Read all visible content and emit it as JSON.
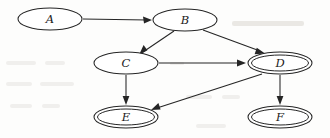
{
  "diagram": {
    "type": "directed-graph",
    "title": "",
    "background_color": "#fdfdfc",
    "stroke_color": "#252525",
    "node_fill": "#ffffff",
    "nodes": [
      {
        "id": "A",
        "label": "A",
        "cx": 50,
        "cy": 19,
        "rx": 32,
        "ry": 11,
        "shape": "ellipse",
        "double": false
      },
      {
        "id": "B",
        "label": "B",
        "cx": 185,
        "cy": 20,
        "rx": 32,
        "ry": 11,
        "shape": "ellipse",
        "double": false
      },
      {
        "id": "C",
        "label": "C",
        "cx": 126,
        "cy": 63,
        "rx": 32,
        "ry": 11,
        "shape": "ellipse",
        "double": false
      },
      {
        "id": "D",
        "label": "D",
        "cx": 280,
        "cy": 63,
        "rx": 32,
        "ry": 11,
        "shape": "double-ellipse",
        "double": true
      },
      {
        "id": "E",
        "label": "E",
        "cx": 126,
        "cy": 117,
        "rx": 32,
        "ry": 11,
        "shape": "double-ellipse",
        "double": true
      },
      {
        "id": "F",
        "label": "F",
        "cx": 280,
        "cy": 117,
        "rx": 32,
        "ry": 11,
        "shape": "double-ellipse",
        "double": true
      }
    ],
    "edges": [
      {
        "id": "A-B",
        "from": "A",
        "to": "B",
        "x1": 83,
        "y1": 19,
        "x2": 151,
        "y2": 20,
        "directed": true,
        "style": "straight"
      },
      {
        "id": "B-C",
        "from": "B",
        "to": "C",
        "x1": 174,
        "y1": 31,
        "x2": 141,
        "y2": 54,
        "directed": true,
        "style": "straight"
      },
      {
        "id": "B-D",
        "from": "B",
        "to": "D",
        "x1": 203,
        "y1": 30,
        "x2": 264,
        "y2": 54,
        "directed": true,
        "style": "straight"
      },
      {
        "id": "C-D",
        "from": "C",
        "to": "D",
        "x1": 159,
        "y1": 63,
        "x2": 246,
        "y2": 63,
        "directed": true,
        "style": "straight"
      },
      {
        "id": "C-E",
        "from": "C",
        "to": "E",
        "x1": 126,
        "y1": 75,
        "x2": 126,
        "y2": 104,
        "directed": true,
        "style": "straight"
      },
      {
        "id": "D-E",
        "from": "D",
        "to": "E",
        "x1": 261,
        "y1": 73,
        "x2": 152,
        "y2": 110,
        "directed": true,
        "style": "straight"
      },
      {
        "id": "D-F",
        "from": "D",
        "to": "F",
        "x1": 280,
        "y1": 75,
        "x2": 280,
        "y2": 104,
        "directed": true,
        "style": "straight"
      }
    ],
    "accepting_nodes": [
      "D",
      "E",
      "F"
    ],
    "start_nodes": [
      "A"
    ]
  },
  "artifacts": {
    "description": "faint scanner bleed-through marks from reverse page",
    "marks": [
      {
        "x": 232,
        "y": 22,
        "w": 72,
        "h": 5
      },
      {
        "x": 6,
        "y": 62,
        "w": 30,
        "h": 4
      },
      {
        "x": 45,
        "y": 62,
        "w": 20,
        "h": 4
      },
      {
        "x": 6,
        "y": 82,
        "w": 26,
        "h": 4
      },
      {
        "x": 40,
        "y": 82,
        "w": 34,
        "h": 4
      },
      {
        "x": 10,
        "y": 104,
        "w": 22,
        "h": 4
      },
      {
        "x": 42,
        "y": 104,
        "w": 18,
        "h": 4
      },
      {
        "x": 186,
        "y": 95,
        "w": 26,
        "h": 4
      },
      {
        "x": 222,
        "y": 95,
        "w": 18,
        "h": 4
      },
      {
        "x": 170,
        "y": 62,
        "w": 14,
        "h": 3
      },
      {
        "x": 196,
        "y": 124,
        "w": 30,
        "h": 4
      }
    ]
  }
}
